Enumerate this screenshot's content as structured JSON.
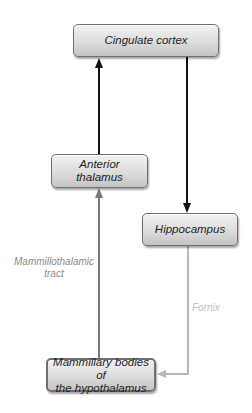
{
  "diagram": {
    "type": "flowchart",
    "title": "",
    "nodes": [
      {
        "id": "cingulate",
        "label": "Cingulate cortex"
      },
      {
        "id": "anterior",
        "label_line1": "Anterior",
        "label_line2": "thalamus"
      },
      {
        "id": "hippocampus",
        "label": "Hippocampus"
      },
      {
        "id": "mammillary",
        "label_line1": "Mammillary bodies of",
        "label_line2": "the hypothalamus"
      }
    ],
    "edges": [
      {
        "from": "anterior",
        "to": "cingulate",
        "label": "",
        "color": "#111111"
      },
      {
        "from": "cingulate",
        "to": "hippocampus",
        "label": "",
        "color": "#111111"
      },
      {
        "from": "hippocampus",
        "to": "mammillary",
        "label": "Fornix",
        "color": "#b5b5b5"
      },
      {
        "from": "mammillary",
        "to": "anterior",
        "label_line1": "Mammillothalamic",
        "label_line2": "tract",
        "color": "#7a7a7a"
      }
    ]
  }
}
